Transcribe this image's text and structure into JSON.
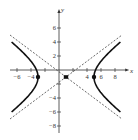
{
  "chart_data": {
    "type": "line",
    "title": "",
    "xlabel": "x",
    "ylabel": "y",
    "xlim": [
      -7,
      9.5
    ],
    "ylim": [
      -9,
      8
    ],
    "grid": false,
    "equation": "(x-1)^2/16 - (y+1)^2/9 = 1",
    "center": [
      1,
      -1
    ],
    "vertices": [
      [
        -3,
        -1
      ],
      [
        5,
        -1
      ]
    ],
    "asymptotes": [
      {
        "name": "asymptote-positive",
        "equation": "y + 1 = (3/4)(x - 1)",
        "style": "dashed"
      },
      {
        "name": "asymptote-negative",
        "equation": "y + 1 = -(3/4)(x - 1)",
        "style": "dashed"
      }
    ],
    "series": [
      {
        "name": "left-branch",
        "style": "solid-bold",
        "x_range": [
          -6.8,
          -3
        ]
      },
      {
        "name": "right-branch",
        "style": "solid-bold",
        "x_range": [
          5,
          8.8
        ]
      }
    ],
    "x_ticks": [
      -6,
      -4,
      4,
      6,
      8
    ],
    "x_tick_labels": [
      "−6",
      "−4",
      "4",
      "6",
      "8"
    ],
    "y_ticks": [
      6,
      4,
      2,
      -4,
      -6,
      -8
    ],
    "y_tick_labels": [
      "6",
      "4",
      "2",
      "−4",
      "−6",
      "−8"
    ],
    "all_x_tick_marks": [
      -6,
      -4,
      -2,
      2,
      4,
      6,
      8
    ],
    "all_y_tick_marks": [
      6,
      4,
      2,
      -2,
      -4,
      -6,
      -8
    ],
    "annotations": [
      {
        "type": "point",
        "at": [
          -3,
          -1
        ],
        "marker": "filled-circle"
      },
      {
        "type": "point",
        "at": [
          5,
          -1
        ],
        "marker": "filled-circle"
      },
      {
        "type": "point",
        "at": [
          1,
          -1
        ],
        "marker": "filled-square-center"
      }
    ]
  },
  "axes": {
    "x_label": "x",
    "y_label": "y"
  }
}
